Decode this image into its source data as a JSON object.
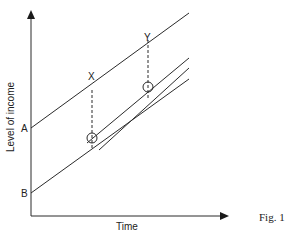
{
  "diagram": {
    "y_axis_label": "Level of income",
    "x_axis_label": "Time",
    "caption": "Fig. 1",
    "intercept_labels": {
      "A": "A",
      "B": "B"
    },
    "point_labels": {
      "X": "X",
      "Y": "Y"
    },
    "lines": [
      {
        "name": "line-from-A",
        "start": [
          31,
          128
        ],
        "end": [
          189,
          13
        ]
      },
      {
        "name": "upper-middle-line",
        "start": [
          88,
          142
        ],
        "end": [
          189,
          58
        ]
      },
      {
        "name": "lower-middle-line",
        "start": [
          100,
          150
        ],
        "end": [
          189,
          68
        ]
      },
      {
        "name": "line-from-B",
        "start": [
          31,
          193
        ],
        "end": [
          189,
          79
        ]
      }
    ],
    "dashed_guides": [
      {
        "name": "X",
        "x": 92,
        "y_top": 90,
        "y_bottom": 149
      },
      {
        "name": "Y",
        "x": 148,
        "y_top": 40,
        "y_bottom": 98
      }
    ],
    "circles": [
      {
        "name": "X-point",
        "cx": 92,
        "cy": 138,
        "r": 5
      },
      {
        "name": "Y-point",
        "cx": 148,
        "cy": 87,
        "r": 5
      }
    ],
    "colors": {
      "ink": "#2a2a2a",
      "background": "#ffffff"
    }
  }
}
